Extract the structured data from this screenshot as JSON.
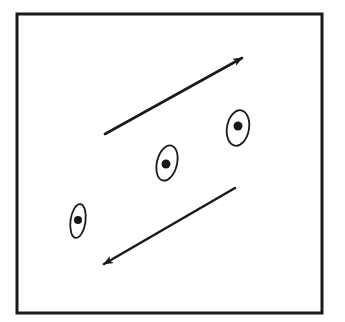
{
  "diagram": {
    "stroke_color": "#1a1a1a",
    "background": "#ffffff",
    "frame": {
      "x": 17,
      "y": 14,
      "width": 305,
      "height": 299,
      "stroke_width": 3
    },
    "arrows": [
      {
        "name": "arrow-up-right",
        "x1": 105,
        "y1": 134,
        "x2": 242,
        "y2": 58
      },
      {
        "name": "arrow-down-left",
        "x1": 235,
        "y1": 188,
        "x2": 104,
        "y2": 264
      }
    ],
    "cells": [
      {
        "name": "cell-1",
        "cx": 78,
        "cy": 221,
        "rx": 7.5,
        "ry": 17,
        "rotate": 8,
        "nx": 78,
        "ny": 220,
        "nr": 4
      },
      {
        "name": "cell-2",
        "cx": 167,
        "cy": 163,
        "rx": 10,
        "ry": 18,
        "rotate": 14,
        "nx": 166,
        "ny": 164,
        "nr": 4.5
      },
      {
        "name": "cell-3",
        "cx": 238,
        "cy": 128,
        "rx": 11,
        "ry": 18,
        "rotate": 10,
        "nx": 238,
        "ny": 126,
        "nr": 4.5
      }
    ]
  }
}
